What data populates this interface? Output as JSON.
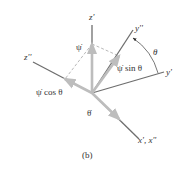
{
  "figure": {
    "caption": "(b)",
    "origin": [
      92,
      93
    ],
    "colors": {
      "axis": "#6e6e6e",
      "vector": "#bdbdbd",
      "dashed": "#9a9a9a",
      "text": "#333333"
    },
    "axes": [
      {
        "id": "z-prime",
        "label": "z'",
        "from": [
          92,
          93
        ],
        "to": [
          92,
          25
        ],
        "label_pos": [
          89,
          20
        ]
      },
      {
        "id": "y-double-prime",
        "label": "y''",
        "from": [
          92,
          93
        ],
        "to": [
          133,
          30
        ],
        "label_pos": [
          135,
          31
        ]
      },
      {
        "id": "y-prime",
        "label": "y'",
        "from": [
          92,
          93
        ],
        "to": [
          164,
          72
        ],
        "label_pos": [
          166,
          75
        ]
      },
      {
        "id": "z-double-prime",
        "label": "z''",
        "from": [
          92,
          93
        ],
        "to": [
          33,
          62
        ],
        "label_pos": [
          24,
          60
        ]
      },
      {
        "id": "x-prime-x-double-prime",
        "label": "x', x''",
        "from": [
          92,
          93
        ],
        "to": [
          139,
          139
        ],
        "label_pos": [
          138,
          143
        ]
      }
    ],
    "vectors": [
      {
        "id": "psi-dot",
        "label": "ψ̇",
        "from": [
          92,
          93
        ],
        "to": [
          92,
          44
        ],
        "label_pos": [
          76,
          50
        ]
      },
      {
        "id": "psi-dot-sin-theta",
        "label": "ψ̇ sin θ",
        "from": [
          92,
          93
        ],
        "to": [
          119,
          56
        ],
        "label_pos": [
          117,
          71
        ]
      },
      {
        "id": "psi-dot-cos-theta",
        "label": "ψ̇  cos θ",
        "from": [
          92,
          93
        ],
        "to": [
          65,
          79
        ],
        "label_pos": [
          36,
          95
        ]
      },
      {
        "id": "theta-dot",
        "label": "θ̇",
        "from": [
          92,
          93
        ],
        "to": [
          119,
          119
        ],
        "label_pos": [
          87,
          116
        ]
      }
    ],
    "dashed_lines": [
      {
        "from": [
          92,
          44
        ],
        "to": [
          65,
          79
        ]
      },
      {
        "from": [
          92,
          44
        ],
        "to": [
          119,
          56
        ]
      }
    ],
    "angle": {
      "label": "θ",
      "arc_from": [
        133,
        38
      ],
      "arc_to": [
        158,
        73
      ],
      "label_pos": [
        153,
        55
      ]
    }
  }
}
